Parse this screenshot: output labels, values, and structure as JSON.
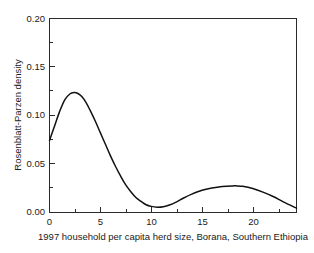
{
  "chart_data": {
    "type": "line",
    "title": "",
    "subtitle": "",
    "xlabel": "1997 household per capita herd size, Borana, Southern Ethiopia",
    "ylabel": "Rosenblatt-Parzen density",
    "xlim": [
      0,
      24.3
    ],
    "ylim": [
      0.0,
      0.2
    ],
    "grid": false,
    "legend": "none",
    "x_ticks": [
      0,
      5,
      10,
      15,
      20
    ],
    "x_tick_labels": [
      "0",
      "5",
      "10",
      "15",
      "20"
    ],
    "x_minor_ticks": [
      2.5,
      7.5,
      12.5,
      17.5,
      22.5
    ],
    "y_ticks": [
      0.0,
      0.05,
      0.1,
      0.15,
      0.2
    ],
    "y_tick_labels": [
      "0.00",
      "0.05",
      "0.10",
      "0.15",
      "0.20"
    ],
    "y_minor_ticks": [
      0.025,
      0.075,
      0.125,
      0.175
    ],
    "line_color": "#111111",
    "background_color": "#ffffff",
    "axis_color": "#2b2b2b",
    "series": [
      {
        "name": "Rosenblatt-Parzen density",
        "x": [
          0.0,
          0.5,
          1.0,
          1.5,
          2.0,
          2.4,
          2.8,
          3.2,
          3.6,
          4.0,
          4.5,
          5.0,
          5.5,
          6.0,
          6.5,
          7.0,
          7.5,
          8.0,
          8.5,
          9.0,
          9.5,
          10.0,
          10.6,
          11.2,
          11.8,
          12.5,
          13.2,
          14.0,
          15.0,
          16.0,
          17.0,
          18.0,
          18.4,
          19.0,
          20.0,
          21.0,
          22.0,
          23.0,
          24.3
        ],
        "y": [
          0.074,
          0.089,
          0.104,
          0.116,
          0.122,
          0.1235,
          0.1225,
          0.119,
          0.113,
          0.105,
          0.094,
          0.082,
          0.07,
          0.058,
          0.047,
          0.037,
          0.028,
          0.021,
          0.015,
          0.011,
          0.0075,
          0.0058,
          0.005,
          0.0055,
          0.0072,
          0.0105,
          0.0145,
          0.0185,
          0.0225,
          0.0248,
          0.0263,
          0.027,
          0.027,
          0.0265,
          0.0242,
          0.0205,
          0.016,
          0.0105,
          0.004
        ]
      }
    ]
  },
  "axis_labels": {
    "x_title": "1997 household per capita herd size, Borana, Southern Ethiopia",
    "y_title": "Rosenblatt-Parzen density"
  }
}
